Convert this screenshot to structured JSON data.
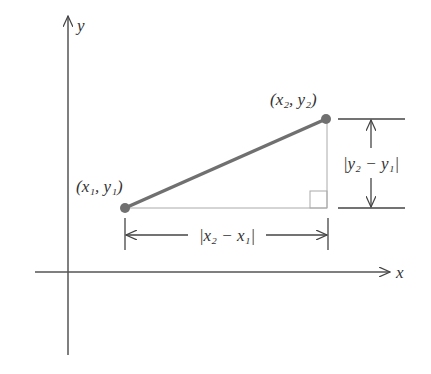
{
  "diagram": {
    "axes": {
      "x_label": "x",
      "y_label": "y"
    },
    "points": [
      {
        "name": "P1",
        "label": "(x₁, y₁)"
      },
      {
        "name": "P2",
        "label": "(x₂, y₂)"
      }
    ],
    "horizontal_distance_label": "|x₂ − x₁|",
    "vertical_distance_label": "|y₂ − y₁|",
    "colors": {
      "segment": "#707070",
      "axis": "#555555",
      "guide": "#aaaaaa",
      "point": "#707070"
    }
  }
}
